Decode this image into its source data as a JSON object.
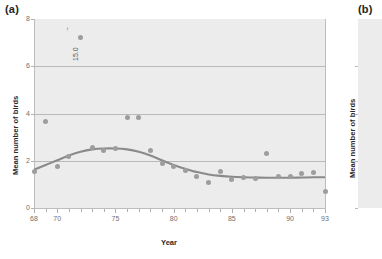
{
  "figure": {
    "panels": [
      {
        "tag": "(a)"
      },
      {
        "tag": "(b)"
      }
    ]
  },
  "panel_a": {
    "tag": "(a)",
    "ylabel": "Mean number of birds",
    "xlabel": "Year",
    "annotation": "15.0",
    "annotation_arrow": "↑"
  },
  "panel_b": {
    "tag": "(b)",
    "ylabel": "Mean number of birds"
  },
  "colors": {
    "plot_background": "#ececec",
    "point": "#9d9d9d",
    "trend_line": "#8a8a8a",
    "gridline": "#b9b9b9",
    "axis": "#bdbdbd",
    "tick_text": "#6f6f6f",
    "title_text": "#2b2b2b"
  },
  "chart_data": {
    "type": "scatter",
    "title": "",
    "xlabel": "Year",
    "ylabel": "Mean number of birds",
    "xlim": [
      68,
      93
    ],
    "ylim": [
      0,
      8
    ],
    "xticks": [
      68,
      70,
      75,
      80,
      85,
      90,
      93
    ],
    "xtick_labels": [
      "68",
      "70",
      "75",
      "80",
      "85",
      "90",
      "93"
    ],
    "xticks_minor": [
      69,
      71,
      72,
      73,
      74,
      76,
      77,
      78,
      79,
      81,
      82,
      83,
      84,
      86,
      87,
      88,
      89,
      91,
      92
    ],
    "yticks": [
      0,
      2,
      4,
      6,
      8
    ],
    "ytick_labels": [
      "0",
      "2",
      "4",
      "6",
      "8"
    ],
    "gridlines_y": [
      2,
      4,
      6
    ],
    "grid": true,
    "legend": "none",
    "annotations": [
      {
        "text": "15.0",
        "x": 71.6,
        "y": 7.0,
        "rotation": 90,
        "arrow": "up",
        "note": "off-scale value marker for the 1972 outlier"
      }
    ],
    "series": [
      {
        "name": "Mean number of birds",
        "type": "scatter",
        "marker": "circle",
        "x": [
          68,
          69,
          70,
          71,
          72,
          73,
          74,
          75,
          76,
          77,
          78,
          79,
          80,
          81,
          82,
          83,
          84,
          85,
          86,
          87,
          88,
          89,
          90,
          91,
          92,
          93
        ],
        "y": [
          1.55,
          3.65,
          1.75,
          2.2,
          7.2,
          2.55,
          2.45,
          2.5,
          3.85,
          3.85,
          2.45,
          1.9,
          1.75,
          1.6,
          1.35,
          1.1,
          1.55,
          1.2,
          1.3,
          1.25,
          2.3,
          1.35,
          1.35,
          1.45,
          1.5,
          0.7
        ]
      },
      {
        "name": "Smoothed trend",
        "type": "line",
        "x": [
          68,
          69,
          70,
          71,
          72,
          73,
          74,
          75,
          76,
          77,
          78,
          79,
          80,
          81,
          82,
          83,
          84,
          85,
          86,
          87,
          88,
          89,
          90,
          91,
          92,
          93
        ],
        "y": [
          1.62,
          1.82,
          2.02,
          2.22,
          2.38,
          2.48,
          2.52,
          2.52,
          2.48,
          2.38,
          2.22,
          2.02,
          1.82,
          1.66,
          1.52,
          1.42,
          1.36,
          1.32,
          1.3,
          1.29,
          1.28,
          1.28,
          1.28,
          1.29,
          1.3,
          1.3
        ]
      }
    ]
  }
}
